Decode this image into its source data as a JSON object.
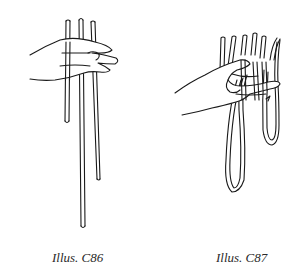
{
  "figures": [
    {
      "id": "C86",
      "caption": "Illus. C86",
      "description": "Hand holding three vertical cords of different lengths"
    },
    {
      "id": "C87",
      "caption": "Illus. C87",
      "description": "Hand holding looped cords hanging in two loops"
    }
  ],
  "colors": {
    "ink": "#1a1a1a",
    "background": "#ffffff"
  }
}
